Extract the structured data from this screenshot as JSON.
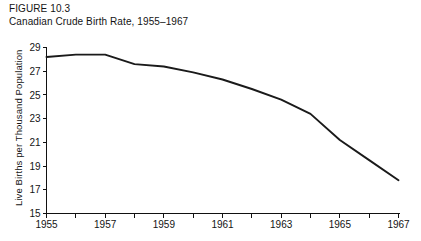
{
  "figure": {
    "number_label": "FIGURE 10.3",
    "caption": "Canadian Crude Birth Rate, 1955–1967"
  },
  "chart_data": {
    "type": "line",
    "title": "Canadian Crude Birth Rate, 1955–1967",
    "xlabel": "",
    "ylabel": "Live Births per Thousand Population",
    "x": [
      1955,
      1956,
      1957,
      1958,
      1959,
      1960,
      1961,
      1962,
      1963,
      1964,
      1965,
      1966,
      1967
    ],
    "values": [
      28.2,
      28.4,
      28.4,
      27.6,
      27.4,
      26.9,
      26.3,
      25.5,
      24.6,
      23.4,
      21.2,
      19.5,
      17.8
    ],
    "series": [
      {
        "name": "Crude birth rate",
        "values": [
          28.2,
          28.4,
          28.4,
          27.6,
          27.4,
          26.9,
          26.3,
          25.5,
          24.6,
          23.4,
          21.2,
          19.5,
          17.8
        ]
      }
    ],
    "xlim": [
      1955,
      1967
    ],
    "ylim": [
      15,
      29
    ],
    "ytick_values": [
      15,
      17,
      19,
      21,
      23,
      25,
      27,
      29
    ],
    "ytick_labels": [
      "15",
      "17",
      "19",
      "21",
      "23",
      "25",
      "27",
      "29"
    ],
    "xtick_values": [
      1955,
      1956,
      1957,
      1958,
      1959,
      1960,
      1961,
      1962,
      1963,
      1964,
      1965,
      1966,
      1967
    ],
    "xtick_labels_shown": [
      "1955",
      "1957",
      "1959",
      "1961",
      "1963",
      "1965",
      "1967"
    ],
    "xtick_labeled_values": [
      1955,
      1957,
      1959,
      1961,
      1963,
      1965,
      1967
    ],
    "grid": false,
    "legend": false,
    "line_color": "#1a1a1a",
    "background_color": "#ffffff"
  }
}
